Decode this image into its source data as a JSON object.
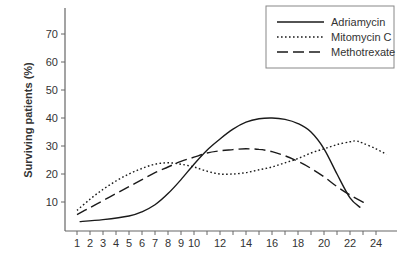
{
  "chart_data": {
    "type": "line",
    "title": "",
    "xlabel": "",
    "ylabel": "Surviving patients (%)",
    "xlim": [
      1,
      24
    ],
    "ylim": [
      0,
      75
    ],
    "grid": false,
    "legend_position": "top-right",
    "x_ticks": [
      1,
      2,
      3,
      4,
      5,
      6,
      7,
      8,
      9,
      10,
      11,
      12,
      13,
      14,
      15,
      16,
      17,
      18,
      19,
      20,
      21,
      22,
      23,
      24
    ],
    "x_tick_labels": [
      "1",
      "2",
      "3",
      "4",
      "5",
      "6",
      "7",
      "8",
      "9",
      "10",
      "12",
      "14",
      "16",
      "18",
      "20",
      "22",
      "24"
    ],
    "y_ticks": [
      10,
      20,
      30,
      40,
      50,
      60,
      70
    ],
    "y_tick_labels": [
      "10",
      "20",
      "30",
      "40",
      "50",
      "60",
      "70"
    ],
    "series": [
      {
        "name": "Adriamycin",
        "style": "solid",
        "x": [
          1.2,
          3,
          5,
          6,
          7,
          8,
          9,
          10,
          11,
          12,
          13,
          14,
          15,
          16,
          17,
          18,
          19,
          20,
          21,
          22,
          22.8
        ],
        "values": [
          3,
          3.7,
          5,
          6.5,
          9,
          13,
          18,
          23.5,
          28.5,
          32.5,
          36,
          38.5,
          39.7,
          40,
          39.5,
          38,
          35,
          29,
          20,
          11.5,
          8
        ]
      },
      {
        "name": "Mitomycin C",
        "style": "dotted",
        "x": [
          1,
          2,
          3,
          4,
          5,
          6,
          7,
          8,
          9,
          10,
          11,
          12,
          13,
          14,
          15,
          16,
          17,
          18,
          19,
          20,
          21,
          22,
          22.5,
          23,
          24,
          24.8
        ],
        "values": [
          7,
          11,
          14.5,
          17.5,
          20,
          22,
          23.5,
          24,
          23.5,
          22.5,
          21,
          20,
          20,
          20.5,
          21.5,
          22.5,
          24,
          25.5,
          27.5,
          29,
          30.5,
          31.5,
          31.8,
          31,
          29,
          27
        ]
      },
      {
        "name": "Methotrexate",
        "style": "dashed",
        "x": [
          1,
          2,
          3,
          4,
          5,
          6,
          7,
          8,
          9,
          10,
          11,
          12,
          13,
          14,
          15,
          16,
          17,
          18,
          19,
          20,
          21,
          22,
          23.2
        ],
        "values": [
          5.5,
          8,
          10.5,
          13,
          15.5,
          18,
          20.5,
          22.5,
          24.5,
          26,
          27.5,
          28.3,
          28.7,
          29,
          28.8,
          28,
          26.5,
          24.5,
          22,
          19,
          15.5,
          12.5,
          9.5
        ]
      }
    ]
  },
  "legend": {
    "items": [
      {
        "label": "Adriamycin",
        "style": "solid"
      },
      {
        "label": "Mitomycin C",
        "style": "dotted"
      },
      {
        "label": "Methotrexate",
        "style": "dashed"
      }
    ]
  },
  "colors": {
    "line": "#1a1a1a",
    "axis": "#666666",
    "text": "#333333",
    "background": "#ffffff"
  }
}
